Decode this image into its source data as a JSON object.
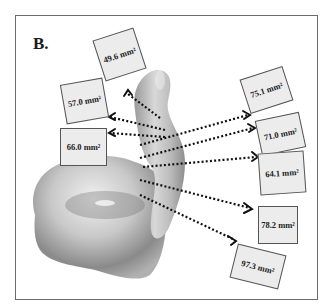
{
  "figure": {
    "panel_label": "B.",
    "unit": "mm²",
    "cross_sections": [
      {
        "id": "cs1",
        "label": "49.6 mm²",
        "value": 49.6
      },
      {
        "id": "cs2",
        "label": "57.0 mm²",
        "value": 57.0
      },
      {
        "id": "cs3",
        "label": "66.0 mm²",
        "value": 66.0
      },
      {
        "id": "cs4",
        "label": "75.1 mm²",
        "value": 75.1
      },
      {
        "id": "cs5",
        "label": "71.0 mm²",
        "value": 71.0
      },
      {
        "id": "cs6",
        "label": "64.1 mm²",
        "value": 64.1
      },
      {
        "id": "cs7",
        "label": "78.2 mm²",
        "value": 78.2
      },
      {
        "id": "cs8",
        "label": "97.3 mm²",
        "value": 97.3
      }
    ],
    "colors": {
      "border": "#6b6b6b",
      "box_fill": "#ececec",
      "arrow": "#111111",
      "model_light": "#e0e0e0",
      "model_dark": "#7a7a7a"
    }
  }
}
